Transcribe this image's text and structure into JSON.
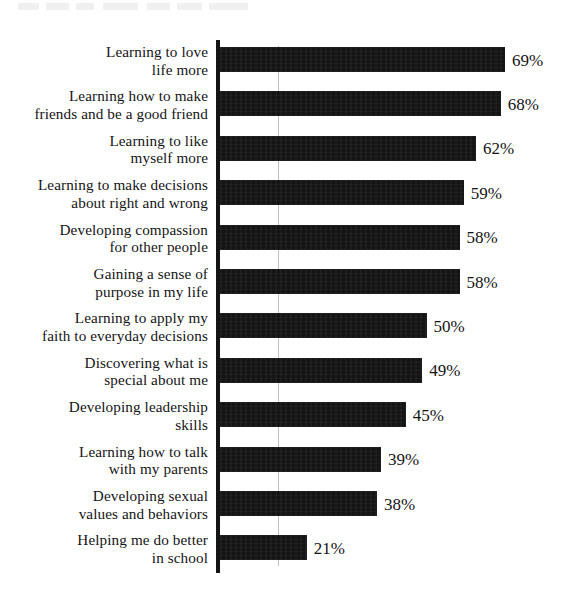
{
  "chart": {
    "type": "bar",
    "orientation": "horizontal",
    "background_color": "#ffffff",
    "bar_color": "#141414",
    "text_color": "#141414",
    "axis_color": "#141414"
  },
  "chart_data": {
    "type": "bar",
    "title": "",
    "xlabel": "",
    "ylabel": "",
    "xlim": [
      0,
      75
    ],
    "grid": false,
    "legend": "none",
    "value_suffix": "%",
    "categories": [
      "Learning to love\nlife more",
      "Learning how to make\nfriends and be a good friend",
      "Learning to like\nmyself more",
      "Learning to make decisions\nabout right and wrong",
      "Developing compassion\nfor other people",
      "Gaining a sense of\npurpose in my life",
      "Learning to apply my\nfaith to everyday decisions",
      "Discovering what is\nspecial about me",
      "Developing leadership\nskills",
      "Learning how to talk\nwith my parents",
      "Developing sexual\nvalues and behaviors",
      "Helping me do better\nin school"
    ],
    "values": [
      69,
      68,
      62,
      59,
      58,
      58,
      50,
      49,
      45,
      39,
      38,
      21
    ],
    "value_labels": [
      "69%",
      "68%",
      "62%",
      "59%",
      "58%",
      "58%",
      "50%",
      "49%",
      "45%",
      "39%",
      "38%",
      "21%"
    ]
  }
}
